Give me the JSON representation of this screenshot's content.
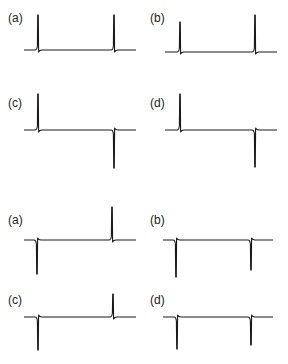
{
  "figure": {
    "groups": [
      {
        "name": "upper-group",
        "panels": [
          {
            "label": "(a)",
            "lx": 8,
            "ly": 12,
            "x0": 24,
            "x1": 136,
            "base": 50,
            "peaks": [
              {
                "x": 38,
                "dir": "up",
                "tip": 15
              },
              {
                "x": 114,
                "dir": "up",
                "tip": 15
              }
            ]
          },
          {
            "label": "(b)",
            "lx": 150,
            "ly": 12,
            "x0": 165,
            "x1": 277,
            "base": 52,
            "peaks": [
              {
                "x": 180,
                "dir": "up",
                "tip": 22
              },
              {
                "x": 255,
                "dir": "up",
                "tip": 15
              }
            ]
          },
          {
            "label": "(c)",
            "lx": 8,
            "ly": 97,
            "x0": 24,
            "x1": 136,
            "base": 130,
            "peaks": [
              {
                "x": 38,
                "dir": "up",
                "tip": 94
              },
              {
                "x": 114,
                "dir": "down",
                "tip": 168
              }
            ]
          },
          {
            "label": "(d)",
            "lx": 150,
            "ly": 97,
            "x0": 165,
            "x1": 277,
            "base": 130,
            "peaks": [
              {
                "x": 180,
                "dir": "up",
                "tip": 94
              },
              {
                "x": 255,
                "dir": "down",
                "tip": 167
              }
            ]
          }
        ]
      },
      {
        "name": "lower-group",
        "panels": [
          {
            "label": "(a)",
            "lx": 8,
            "ly": 214,
            "x0": 24,
            "x1": 136,
            "base": 240,
            "peaks": [
              {
                "x": 37,
                "dir": "down",
                "tip": 274
              },
              {
                "x": 112,
                "dir": "up",
                "tip": 207
              }
            ]
          },
          {
            "label": "(b)",
            "lx": 150,
            "ly": 214,
            "x0": 163,
            "x1": 273,
            "base": 240,
            "peaks": [
              {
                "x": 176,
                "dir": "down",
                "tip": 277
              },
              {
                "x": 251,
                "dir": "down",
                "tip": 270
              }
            ]
          },
          {
            "label": "(c)",
            "lx": 8,
            "ly": 294,
            "x0": 24,
            "x1": 136,
            "base": 317,
            "peaks": [
              {
                "x": 38,
                "dir": "down",
                "tip": 350
              },
              {
                "x": 113,
                "dir": "up",
                "tip": 294
              }
            ]
          },
          {
            "label": "(d)",
            "lx": 150,
            "ly": 294,
            "x0": 163,
            "x1": 273,
            "base": 317,
            "peaks": [
              {
                "x": 177,
                "dir": "down",
                "tip": 349
              },
              {
                "x": 251,
                "dir": "down",
                "tip": 345
              }
            ]
          }
        ]
      }
    ],
    "line_color": "#1a1a1a"
  },
  "chart_data": [
    {
      "type": "line",
      "title": "(a)",
      "group": "upper",
      "description": "flat baseline with two positive spikes",
      "x": [
        0.12,
        0.8
      ],
      "values": [
        1.0,
        1.0
      ]
    },
    {
      "type": "line",
      "title": "(b)",
      "group": "upper",
      "description": "flat baseline with two positive spikes, small negative dip after each",
      "x": [
        0.13,
        0.81
      ],
      "values": [
        0.85,
        1.0
      ]
    },
    {
      "type": "line",
      "title": "(c)",
      "group": "upper",
      "description": "positive spike then negative spike",
      "x": [
        0.12,
        0.8
      ],
      "values": [
        1.0,
        -1.0
      ]
    },
    {
      "type": "line",
      "title": "(d)",
      "group": "upper",
      "description": "positive spike then negative spike",
      "x": [
        0.13,
        0.81
      ],
      "values": [
        1.0,
        -1.0
      ]
    },
    {
      "type": "line",
      "title": "(a)",
      "group": "lower",
      "description": "negative spike then positive spike",
      "x": [
        0.12,
        0.79
      ],
      "values": [
        -1.0,
        1.0
      ]
    },
    {
      "type": "line",
      "title": "(b)",
      "group": "lower",
      "description": "two negative spikes",
      "x": [
        0.12,
        0.8
      ],
      "values": [
        -1.0,
        -0.8
      ]
    },
    {
      "type": "line",
      "title": "(c)",
      "group": "lower",
      "description": "negative spike then smaller positive spike",
      "x": [
        0.13,
        0.8
      ],
      "values": [
        -1.0,
        0.7
      ]
    },
    {
      "type": "line",
      "title": "(d)",
      "group": "lower",
      "description": "two negative spikes",
      "x": [
        0.13,
        0.8
      ],
      "values": [
        -1.0,
        -0.9
      ]
    }
  ]
}
